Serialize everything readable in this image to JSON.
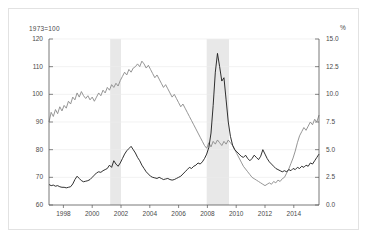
{
  "chart_data": {
    "type": "line",
    "title": "",
    "subtitle": "",
    "xlabel": "",
    "ylabel": "1973=100",
    "ylabel_right": "%",
    "grid": true,
    "legend": "none",
    "xlim": [
      1997.0,
      2015.75
    ],
    "ylim": [
      60,
      120
    ],
    "ylim_right": [
      0.0,
      15.0
    ],
    "xticks": [
      "1998",
      "2000",
      "2002",
      "2004",
      "2006",
      "2008",
      "2010",
      "2012",
      "2014"
    ],
    "xtick_values": [
      1998,
      2000,
      2002,
      2004,
      2006,
      2008,
      2010,
      2012,
      2014
    ],
    "yticks_left": [
      "120",
      "110",
      "100",
      "90",
      "80",
      "70",
      "60"
    ],
    "ytick_values_left": [
      120,
      110,
      100,
      90,
      80,
      70,
      60
    ],
    "yticks_right": [
      "15.0",
      "12.5",
      "10.0",
      "7.5",
      "5.0",
      "2.5",
      "0.0"
    ],
    "ytick_values_right": [
      15.0,
      12.5,
      10.0,
      7.5,
      5.0,
      2.5,
      0.0
    ],
    "shaded_bands": [
      {
        "name": "recession-band-2001",
        "start": 2001.25,
        "end": 2002.0,
        "color": "#e8e8e8"
      },
      {
        "name": "recession-band-2008",
        "start": 2007.95,
        "end": 2009.5,
        "color": "#e8e8e8"
      }
    ],
    "series": [
      {
        "name": "index-series",
        "axis": "left",
        "color": "#8a8a8a",
        "unit": "1973=100",
        "x": [
          1997.0,
          1997.15,
          1997.3,
          1997.45,
          1997.6,
          1997.75,
          1997.9,
          1998.05,
          1998.2,
          1998.35,
          1998.5,
          1998.65,
          1998.8,
          1998.95,
          1999.1,
          1999.25,
          1999.4,
          1999.55,
          1999.7,
          1999.85,
          2000.0,
          2000.15,
          2000.3,
          2000.45,
          2000.6,
          2000.75,
          2000.9,
          2001.05,
          2001.2,
          2001.35,
          2001.5,
          2001.65,
          2001.8,
          2001.95,
          2002.1,
          2002.25,
          2002.4,
          2002.55,
          2002.7,
          2002.85,
          2003.0,
          2003.15,
          2003.3,
          2003.45,
          2003.6,
          2003.75,
          2003.9,
          2004.05,
          2004.2,
          2004.35,
          2004.5,
          2004.65,
          2004.8,
          2004.95,
          2005.1,
          2005.25,
          2005.4,
          2005.55,
          2005.7,
          2005.85,
          2006.0,
          2006.15,
          2006.3,
          2006.45,
          2006.6,
          2006.75,
          2006.9,
          2007.05,
          2007.2,
          2007.35,
          2007.5,
          2007.65,
          2007.8,
          2007.95,
          2008.1,
          2008.25,
          2008.4,
          2008.55,
          2008.7,
          2008.85,
          2009.0,
          2009.15,
          2009.3,
          2009.45,
          2009.6,
          2009.75,
          2009.9,
          2010.05,
          2010.2,
          2010.35,
          2010.5,
          2010.65,
          2010.8,
          2010.95,
          2011.1,
          2011.25,
          2011.4,
          2011.55,
          2011.7,
          2011.85,
          2012.0,
          2012.15,
          2012.3,
          2012.45,
          2012.6,
          2012.75,
          2012.9,
          2013.05,
          2013.2,
          2013.35,
          2013.5,
          2013.65,
          2013.8,
          2013.95,
          2014.1,
          2014.25,
          2014.4,
          2014.55,
          2014.7,
          2014.85,
          2015.0,
          2015.15,
          2015.3,
          2015.45,
          2015.6,
          2015.75
        ],
        "values": [
          90.0,
          93.5,
          92.0,
          94.5,
          93.0,
          95.5,
          94.0,
          96.0,
          95.0,
          97.5,
          96.5,
          99.0,
          98.0,
          100.5,
          99.0,
          101.0,
          99.5,
          98.5,
          99.5,
          98.0,
          99.0,
          97.5,
          99.0,
          100.5,
          99.5,
          101.5,
          100.5,
          102.5,
          101.5,
          103.5,
          102.5,
          104.0,
          103.0,
          105.0,
          106.5,
          108.0,
          107.0,
          109.0,
          108.0,
          109.5,
          110.0,
          111.0,
          110.0,
          112.0,
          111.0,
          109.5,
          110.5,
          109.0,
          107.5,
          106.0,
          107.0,
          105.5,
          104.0,
          102.5,
          103.5,
          102.0,
          100.5,
          99.0,
          100.0,
          98.5,
          97.0,
          95.5,
          96.5,
          95.0,
          93.5,
          92.0,
          90.5,
          89.0,
          87.5,
          86.0,
          84.5,
          83.0,
          81.5,
          80.5,
          82.5,
          81.0,
          83.0,
          82.0,
          83.5,
          82.5,
          81.5,
          83.0,
          82.0,
          83.5,
          82.5,
          81.5,
          80.0,
          78.5,
          77.0,
          75.5,
          74.0,
          73.0,
          72.0,
          71.0,
          70.0,
          69.5,
          69.0,
          68.5,
          68.0,
          67.5,
          67.0,
          67.5,
          68.0,
          67.5,
          68.5,
          68.0,
          69.0,
          68.5,
          69.5,
          70.0,
          71.5,
          73.0,
          75.0,
          77.0,
          79.5,
          82.5,
          85.0,
          86.5,
          88.0,
          87.0,
          88.5,
          90.0,
          89.0,
          91.0,
          90.0,
          92.5
        ]
      },
      {
        "name": "percent-series",
        "axis": "right",
        "color": "#1a1a1a",
        "unit": "%",
        "x": [
          1997.0,
          1997.15,
          1997.3,
          1997.45,
          1997.6,
          1997.75,
          1997.9,
          1998.05,
          1998.2,
          1998.35,
          1998.5,
          1998.65,
          1998.8,
          1998.95,
          1999.1,
          1999.25,
          1999.4,
          1999.55,
          1999.7,
          1999.85,
          2000.0,
          2000.15,
          2000.3,
          2000.45,
          2000.6,
          2000.75,
          2000.9,
          2001.05,
          2001.2,
          2001.35,
          2001.5,
          2001.65,
          2001.8,
          2001.95,
          2002.1,
          2002.25,
          2002.4,
          2002.55,
          2002.7,
          2002.85,
          2003.0,
          2003.15,
          2003.3,
          2003.45,
          2003.6,
          2003.75,
          2003.9,
          2004.05,
          2004.2,
          2004.35,
          2004.5,
          2004.65,
          2004.8,
          2004.95,
          2005.1,
          2005.25,
          2005.4,
          2005.55,
          2005.7,
          2005.85,
          2006.0,
          2006.15,
          2006.3,
          2006.45,
          2006.6,
          2006.75,
          2006.9,
          2007.05,
          2007.2,
          2007.35,
          2007.5,
          2007.65,
          2007.8,
          2007.95,
          2008.1,
          2008.25,
          2008.4,
          2008.55,
          2008.7,
          2008.85,
          2009.0,
          2009.15,
          2009.3,
          2009.45,
          2009.6,
          2009.75,
          2009.9,
          2010.05,
          2010.2,
          2010.35,
          2010.5,
          2010.65,
          2010.8,
          2010.95,
          2011.1,
          2011.25,
          2011.4,
          2011.55,
          2011.7,
          2011.85,
          2012.0,
          2012.15,
          2012.3,
          2012.45,
          2012.6,
          2012.75,
          2012.9,
          2013.05,
          2013.2,
          2013.35,
          2013.5,
          2013.65,
          2013.8,
          2013.95,
          2014.1,
          2014.25,
          2014.4,
          2014.55,
          2014.7,
          2014.85,
          2015.0,
          2015.15,
          2015.3,
          2015.45,
          2015.6,
          2015.75
        ],
        "values": [
          1.85,
          1.75,
          1.8,
          1.7,
          1.75,
          1.65,
          1.6,
          1.6,
          1.55,
          1.6,
          1.65,
          1.9,
          2.3,
          2.6,
          2.4,
          2.2,
          2.1,
          2.15,
          2.2,
          2.3,
          2.5,
          2.7,
          2.9,
          3.0,
          2.95,
          3.1,
          3.2,
          3.3,
          3.6,
          3.4,
          4.0,
          3.7,
          3.5,
          3.8,
          4.2,
          4.6,
          4.9,
          5.1,
          5.3,
          5.0,
          4.7,
          4.3,
          4.0,
          3.6,
          3.3,
          3.0,
          2.8,
          2.6,
          2.5,
          2.45,
          2.4,
          2.5,
          2.4,
          2.3,
          2.35,
          2.4,
          2.3,
          2.25,
          2.3,
          2.4,
          2.5,
          2.6,
          2.8,
          3.0,
          3.2,
          3.4,
          3.3,
          3.5,
          3.6,
          3.8,
          3.7,
          3.9,
          4.2,
          4.6,
          5.2,
          6.5,
          9.0,
          12.0,
          13.7,
          12.5,
          11.2,
          11.5,
          9.5,
          7.5,
          6.2,
          5.4,
          5.0,
          4.8,
          4.6,
          4.4,
          4.3,
          4.5,
          4.2,
          4.0,
          4.2,
          4.5,
          4.3,
          4.1,
          4.4,
          5.0,
          4.6,
          4.2,
          3.9,
          3.7,
          3.5,
          3.3,
          3.2,
          3.1,
          3.0,
          3.1,
          3.0,
          3.2,
          3.1,
          3.3,
          3.2,
          3.4,
          3.3,
          3.5,
          3.4,
          3.6,
          3.5,
          3.8,
          3.7,
          4.0,
          4.3,
          4.6
        ]
      }
    ]
  }
}
